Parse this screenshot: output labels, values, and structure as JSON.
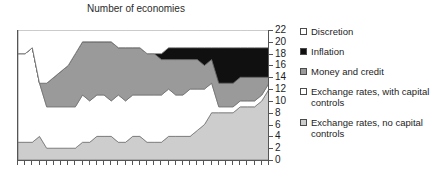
{
  "chart_data": {
    "type": "area",
    "stacked": true,
    "title": "Number of economies",
    "xlabel": "",
    "ylabel": "",
    "ylim": [
      0,
      22
    ],
    "ytick_labels": [
      "22",
      "20",
      "18",
      "16",
      "14",
      "12",
      "10",
      "8",
      "6",
      "4",
      "2",
      "0"
    ],
    "ytick_values": [
      22,
      20,
      18,
      16,
      14,
      12,
      10,
      8,
      6,
      4,
      2,
      0
    ],
    "yaxis_position": "right",
    "grid": false,
    "legend_position": "right",
    "xtick_count": 36,
    "xtick_labels": [],
    "x": [
      1,
      2,
      3,
      4,
      5,
      6,
      7,
      8,
      9,
      10,
      11,
      12,
      13,
      14,
      15,
      16,
      17,
      18,
      19,
      20,
      21,
      22,
      23,
      24,
      25,
      26,
      27,
      28,
      29,
      30,
      31,
      32,
      33,
      34,
      35,
      36
    ],
    "series": [
      {
        "name": "Exchange rates, no capital controls",
        "color": "#cdcdcd",
        "values": [
          3,
          3,
          3,
          4,
          2,
          2,
          2,
          2,
          2,
          3,
          3,
          4,
          4,
          4,
          3,
          3,
          4,
          4,
          3,
          3,
          3,
          4,
          4,
          4,
          4,
          5,
          6,
          8,
          8,
          8,
          8,
          9,
          9,
          9,
          10,
          12
        ]
      },
      {
        "name": "Exchange rates, with capital controls",
        "color": "#ffffff",
        "values": [
          15,
          15,
          16,
          9,
          7,
          7,
          7,
          7,
          7,
          8,
          7,
          7,
          7,
          6,
          8,
          7,
          7,
          7,
          8,
          8,
          8,
          8,
          7,
          7,
          8,
          7,
          6,
          5,
          1,
          1,
          1,
          1,
          1,
          1,
          1,
          1
        ]
      },
      {
        "name": "Money and credit",
        "color": "#9a9a9a",
        "values": [
          0,
          0,
          0,
          0,
          4,
          5,
          6,
          7,
          9,
          9,
          10,
          9,
          9,
          10,
          8,
          9,
          8,
          8,
          7,
          7,
          6,
          5,
          6,
          6,
          5,
          5,
          4,
          4,
          4,
          4,
          4,
          4,
          4,
          4,
          3,
          1
        ]
      },
      {
        "name": "Inflation",
        "color": "#101010",
        "values": [
          0,
          0,
          0,
          0,
          0,
          0,
          0,
          0,
          0,
          0,
          0,
          0,
          0,
          0,
          0,
          0,
          0,
          0,
          0,
          0,
          1,
          2,
          2,
          2,
          2,
          2,
          3,
          2,
          6,
          6,
          6,
          5,
          5,
          5,
          5,
          5
        ]
      },
      {
        "name": "Discretion",
        "color": "#ffffff",
        "values": [
          4,
          4,
          3,
          9,
          9,
          8,
          7,
          6,
          4,
          2,
          2,
          2,
          2,
          2,
          3,
          3,
          3,
          3,
          4,
          4,
          4,
          3,
          3,
          3,
          3,
          3,
          3,
          3,
          3,
          3,
          3,
          3,
          3,
          3,
          3,
          3
        ]
      }
    ]
  },
  "legend": {
    "items": [
      {
        "label": "Discretion",
        "swatch": "sw-white"
      },
      {
        "label": "Inflation",
        "swatch": "sw-black"
      },
      {
        "label": "Money and credit",
        "swatch": "sw-dgray"
      },
      {
        "label": "Exchange rates, with capital\ncontrols",
        "swatch": "sw-white"
      },
      {
        "label": "Exchange rates, no capital\ncontrols",
        "swatch": "sw-lgray"
      }
    ]
  }
}
